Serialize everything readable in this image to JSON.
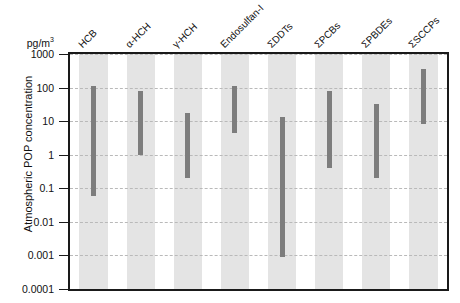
{
  "chart_data": {
    "type": "bar",
    "subtype": "floating-range-bar",
    "title": "",
    "xlabel": "",
    "ylabel": "Atmospheric POP concentration",
    "yunit": "pg/m³",
    "yscale": "log",
    "ylim": [
      0.0001,
      1000
    ],
    "ytick_labels": [
      "1000",
      "100",
      "10",
      "1",
      "0.1",
      "0.01",
      "0.001",
      "0.0001"
    ],
    "ytick_values": [
      1000,
      100,
      10,
      1,
      0.1,
      0.01,
      0.001,
      0.0001
    ],
    "grid": true,
    "grid_style": "dashed horizontal",
    "legend": "none",
    "categories": [
      "HCB",
      "α-HCH",
      "γ-HCH",
      "Endosulfan-I",
      "ΣDDTs",
      "ΣPCBs",
      "ΣPBDEs",
      "ΣSCCPs"
    ],
    "series": [
      {
        "name": "concentration range (min–max)",
        "low": [
          0.06,
          1.0,
          0.2,
          4.5,
          0.0009,
          0.4,
          0.2,
          8
        ],
        "high": [
          110,
          80,
          18,
          110,
          13,
          80,
          33,
          350
        ]
      }
    ],
    "bar_color": "#7d7d7d",
    "band_color": "#e4e4e4",
    "axis_color": "#1a1a1a",
    "gridline_color": "#b9b9b9"
  },
  "axis": {
    "unit_label": "pg/m",
    "unit_exponent": "3",
    "y_title": "Atmospheric POP concentration"
  }
}
